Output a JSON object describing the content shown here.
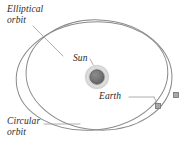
{
  "figure": {
    "background_color": "#ffffff",
    "width": 185,
    "height": 150
  },
  "labels": {
    "elliptical_orbit": "Elliptical\norbit",
    "circular_orbit": "Circular\norbit",
    "sun": "Sun",
    "earth": "Earth"
  },
  "colors": {
    "orbit_stroke": "#8a8a8a",
    "leader_line": "#9a9a9a",
    "sun_core": "#6e6e6e",
    "sun_halo": "#cfcfcf",
    "sun_halo_outer": "#e8e8e8",
    "earth_marker_fill": "#a8a8a8",
    "earth_marker_stroke": "#707070",
    "text": "#2b2b2b"
  },
  "diagram_data": {
    "type": "diagram",
    "subject": "orbital paths",
    "bodies": [
      {
        "name": "Sun",
        "shape": "circle",
        "center": [
          97,
          77
        ],
        "core_radius": 7,
        "halo_radius": 11.5,
        "halo_outer_radius": 14
      },
      {
        "name": "Earth",
        "shape": "square-marker",
        "positions": [
          {
            "on_orbit": "elliptical",
            "center": [
              158,
              106
            ],
            "size": 5
          },
          {
            "on_orbit": "circular",
            "center": [
              176,
              95
            ],
            "size": 5
          }
        ]
      }
    ],
    "orbits": [
      {
        "name": "Elliptical orbit",
        "shape": "ellipse",
        "center": [
          92,
          76
        ],
        "radius_x": 76,
        "radius_y": 54,
        "rotation_deg": -6,
        "stroke": "#8a8a8a",
        "stroke_width": 1
      },
      {
        "name": "Circular orbit",
        "shape": "ellipse",
        "center": [
          99,
          75
        ],
        "radius_x": 73,
        "radius_y": 55,
        "rotation_deg": 4,
        "stroke": "#8a8a8a",
        "stroke_width": 1
      }
    ],
    "leader_lines": [
      {
        "from_label": "Elliptical orbit",
        "points": [
          [
            33,
            26
          ],
          [
            62,
            55
          ]
        ]
      },
      {
        "from_label": "Circular orbit",
        "points": [
          [
            44,
            124
          ],
          [
            78,
            124
          ]
        ]
      },
      {
        "from_label": "Sun",
        "points": [
          [
            90,
            58
          ],
          [
            97,
            71
          ]
        ]
      },
      {
        "from_label": "Earth",
        "points": [
          [
            128,
            97
          ],
          [
            155,
            97
          ]
        ]
      },
      {
        "from_label": "Earth",
        "points": [
          [
            155,
            97
          ],
          [
            158,
            104
          ]
        ]
      }
    ]
  }
}
